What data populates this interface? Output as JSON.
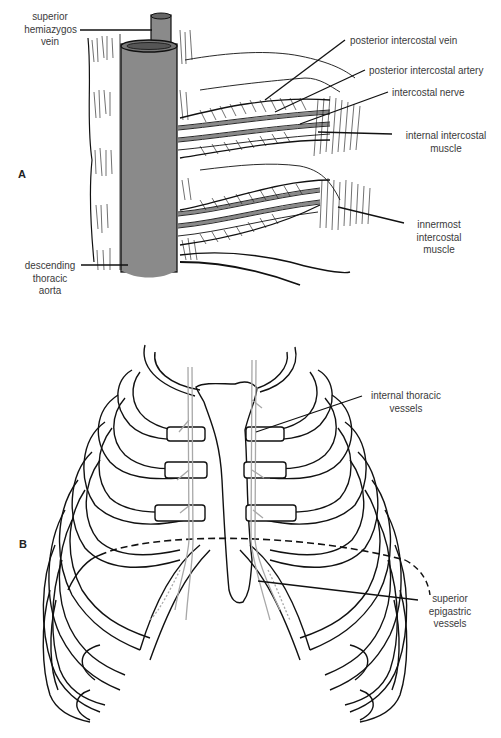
{
  "figure": {
    "panels": [
      {
        "id": "A",
        "letter": "A",
        "labels": {
          "superior_hemiazygos_vein": [
            "superior",
            "hemiazygos",
            "vein"
          ],
          "posterior_intercostal_vein": "posterior intercostal vein",
          "posterior_intercostal_artery": "posterior intercostal artery",
          "intercostal_nerve": "intercostal nerve",
          "internal_intercostal_muscle": [
            "internal intercostal",
            "muscle"
          ],
          "innermost_intercostal_muscle": [
            "innermost",
            "intercostal",
            "muscle"
          ],
          "descending_thoracic_aorta": [
            "descending",
            "thoracic",
            "aorta"
          ]
        }
      },
      {
        "id": "B",
        "letter": "B",
        "labels": {
          "internal_thoracic_vessels": [
            "internal thoracic",
            "vessels"
          ],
          "superior_epigastric_vessels": [
            "superior",
            "epigastric",
            "vessels"
          ]
        }
      }
    ],
    "colors": {
      "aorta_fill": "#8a8a8a",
      "line": "#111111",
      "vessel_gray": "#a8a8a8",
      "label_text": "#3a3a3a"
    }
  }
}
